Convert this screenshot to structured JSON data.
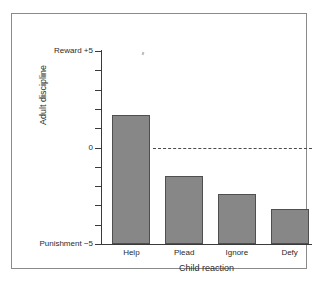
{
  "chart_data": {
    "type": "bar",
    "title": "",
    "categories": [
      "Help",
      "Plead",
      "Ignore",
      "Defy"
    ],
    "values": [
      1.7,
      -1.5,
      -2.4,
      -3.2
    ],
    "xlabel": "Child reaction",
    "ylabel": "Adult discipline",
    "ylim": [
      -5,
      5
    ],
    "ytick_values": [
      5,
      4,
      3,
      2,
      1,
      0,
      -1,
      -2,
      -3,
      -4,
      -5
    ],
    "ytick_labels": [
      "Reward +5",
      "",
      "",
      "",
      "",
      "0",
      "",
      "",
      "",
      "",
      "Punishment −5"
    ],
    "axis_endpoint_labels": {
      "top": "Reward +5",
      "middle": "0",
      "bottom": "Punishment −5"
    },
    "grid": false,
    "legend": false,
    "zero_reference_line": {
      "value": 0,
      "style": "dashed"
    },
    "bar_color": "#878787",
    "bar_edge_color": "#4f4f4f",
    "axis_color": "#3a3a3a",
    "frame_color": "#8a8a8a",
    "background_color": "#ffffff"
  }
}
